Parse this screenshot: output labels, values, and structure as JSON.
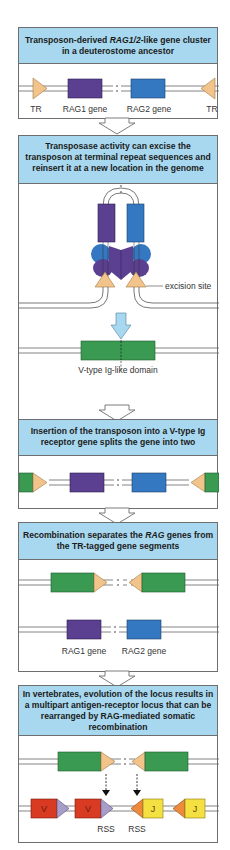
{
  "panels": [
    {
      "header_parts": [
        "Transposon-derived ",
        "RAG1/2",
        "-like gene cluster in a deuterostome ancestor"
      ],
      "labels": {
        "tr_left": "TR",
        "rag1": "RAG1 gene",
        "rag2": "RAG2 gene",
        "tr_right": "TR"
      }
    },
    {
      "header": "Transposase activity can excise the transposon at terminal repeat sequences and reinsert it at a new location in the genome",
      "labels": {
        "excision": "excision site",
        "vdomain": "V-type Ig-like domain"
      }
    },
    {
      "header": "Insertion of the transposon into a V-type Ig receptor gene splits the gene into two"
    },
    {
      "header_parts": [
        "Recombination separates the ",
        "RAG",
        " genes from the TR-tagged gene segments"
      ],
      "labels": {
        "rag1": "RAG1 gene",
        "rag2": "RAG2 gene"
      }
    },
    {
      "header": "In vertebrates, evolution of the locus results in a multipart antigen-receptor locus that can be rearranged by RAG-mediated somatic recombination",
      "labels": {
        "v1": "V",
        "v2": "V",
        "j1": "J",
        "j2": "J",
        "rss1": "RSS",
        "rss2": "RSS"
      }
    }
  ],
  "colors": {
    "header_bg": "#a8d8ef",
    "rag1": "#5b3f91",
    "rag2": "#3478c1",
    "tr": "#f2c48c",
    "v_gene_domain": "#3a9a52",
    "v_segment": "#d93a22",
    "j_segment": "#f4e040",
    "rss_v": "#a89cc8",
    "rss_j": "#ee8a3c",
    "arrow": "#a8d8ef"
  }
}
